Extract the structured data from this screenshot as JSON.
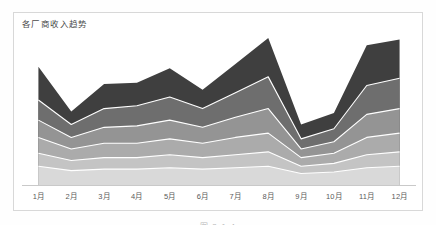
{
  "figure": {
    "caption": "图 2-1-4"
  },
  "chart": {
    "title": "各厂商收入趋势",
    "frame_border_color": "#d8d8d8",
    "axis_line_color": "#c9c9c9",
    "plot_background": "#ffffff",
    "separator_color": "#ffffff"
  },
  "chart_data": {
    "type": "area",
    "stacked": true,
    "title": "各厂商收入趋势",
    "xlabel": "",
    "ylabel": "",
    "grid": false,
    "legend": "none",
    "categories": [
      "1月",
      "2月",
      "3月",
      "4月",
      "5月",
      "6月",
      "7月",
      "8月",
      "9月",
      "10月",
      "11月",
      "12月"
    ],
    "ylim": [
      0,
      100
    ],
    "series": [
      {
        "name": "厂商一",
        "color": "#d9d9d9",
        "values": [
          13,
          10,
          11,
          11,
          12,
          11,
          12,
          13,
          8,
          9,
          12,
          13
        ]
      },
      {
        "name": "厂商二",
        "color": "#c4c4c4",
        "values": [
          9,
          7,
          8,
          8,
          9,
          8,
          9,
          10,
          5,
          6,
          9,
          10
        ]
      },
      {
        "name": "厂商三",
        "color": "#ababab",
        "values": [
          11,
          8,
          10,
          10,
          11,
          10,
          12,
          13,
          6,
          7,
          12,
          13
        ]
      },
      {
        "name": "厂商四",
        "color": "#949494",
        "values": [
          12,
          8,
          11,
          12,
          13,
          11,
          14,
          17,
          6,
          8,
          16,
          17
        ]
      },
      {
        "name": "厂商五",
        "color": "#6e6e6e",
        "values": [
          14,
          9,
          13,
          14,
          16,
          13,
          17,
          22,
          7,
          9,
          20,
          21
        ]
      },
      {
        "name": "厂商六",
        "color": "#3f3f3f",
        "values": [
          23,
          9,
          17,
          16,
          20,
          13,
          20,
          27,
          10,
          11,
          28,
          27
        ]
      }
    ]
  }
}
